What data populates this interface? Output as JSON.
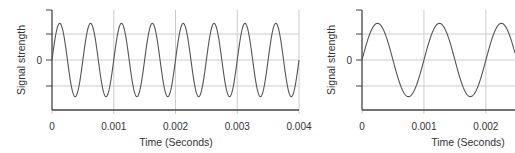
{
  "chart_data": [
    {
      "type": "line",
      "title": "",
      "xlabel": "Time (Seconds)",
      "ylabel": "Signal strength",
      "xlim": [
        0,
        0.004
      ],
      "ylim": [
        -1.2,
        1.2
      ],
      "x_ticks": [
        0,
        0.001,
        0.002,
        0.003,
        0.004
      ],
      "x_tick_labels": [
        "0",
        "0.001",
        "0.002",
        "0.003",
        "0.004"
      ],
      "y_ticks": [
        0
      ],
      "y_tick_labels": [
        "0"
      ],
      "grid": true,
      "series": [
        {
          "name": "signal",
          "function": "sine",
          "amplitude": 1,
          "frequency_hz": 2000,
          "phase": 0
        }
      ]
    },
    {
      "type": "line",
      "title": "",
      "xlabel": "Time (Seconds)",
      "ylabel": "Signal strength",
      "xlim": [
        0,
        0.00247
      ],
      "ylim": [
        -1.2,
        1.2
      ],
      "x_ticks": [
        0,
        0.001,
        0.002
      ],
      "x_tick_labels": [
        "0",
        "0.001",
        "0.002"
      ],
      "y_ticks": [
        0
      ],
      "y_tick_labels": [
        "0"
      ],
      "grid": true,
      "series": [
        {
          "name": "signal",
          "function": "sine",
          "amplitude": 1,
          "frequency_hz": 1000,
          "phase": 0
        }
      ]
    }
  ],
  "colors": {
    "curve": "#555555",
    "axis": "#444444",
    "grid": "#cccccc"
  }
}
